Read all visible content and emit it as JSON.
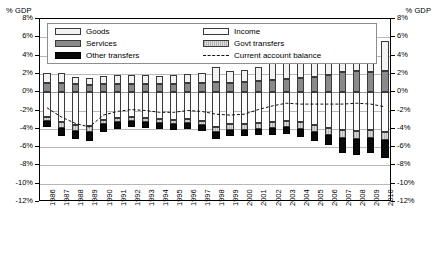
{
  "axis_unit_left": "% GDP",
  "axis_unit_right": "% GDP",
  "legend": {
    "goods": "Goods",
    "services": "Services",
    "other_transfers": "Other transfers",
    "income": "Income",
    "govt_transfers": "Govt transfers",
    "current_account_balance": "Current account balance"
  },
  "chart_data": {
    "type": "bar",
    "title": "",
    "subtitle": "",
    "xlabel": "",
    "ylabel": "% GDP",
    "ylim": [
      -12,
      8
    ],
    "ytick_step": 2,
    "grid": true,
    "stacked": true,
    "legend_position": "top-inside",
    "ytick_labels": [
      "8%",
      "6%",
      "4%",
      "2%",
      "0%",
      "-2%",
      "-4%",
      "-6%",
      "-8%",
      "-10%",
      "-12%"
    ],
    "categories": [
      "1986",
      "1987",
      "1988",
      "1989",
      "1990",
      "1991",
      "1992",
      "1993",
      "1994",
      "1995",
      "1996",
      "1997",
      "1998",
      "1999",
      "2000",
      "2001",
      "2002",
      "2003",
      "2004",
      "2005",
      "2006",
      "2007",
      "2008",
      "2009",
      "2010"
    ],
    "series": [
      {
        "name": "Goods",
        "values": [
          1.1,
          1.1,
          0.8,
          0.7,
          0.9,
          1.0,
          1.0,
          1.0,
          0.9,
          1.0,
          1.0,
          1.1,
          1.6,
          1.3,
          1.3,
          1.6,
          1.9,
          2.0,
          2.1,
          2.3,
          2.6,
          3.1,
          3.4,
          3.2,
          3.3
        ]
      },
      {
        "name": "Services",
        "values": [
          1.0,
          1.0,
          0.9,
          0.8,
          0.9,
          0.9,
          0.9,
          0.9,
          0.9,
          0.9,
          1.0,
          1.0,
          1.1,
          1.0,
          1.1,
          1.2,
          1.3,
          1.4,
          1.5,
          1.7,
          1.9,
          2.2,
          2.3,
          2.2,
          2.3
        ]
      },
      {
        "name": "Income",
        "values": [
          -2.7,
          -3.3,
          -3.6,
          -3.7,
          -3.0,
          -2.8,
          -2.7,
          -2.8,
          -2.9,
          -3.0,
          -2.9,
          -3.1,
          -3.8,
          -3.5,
          -3.5,
          -3.4,
          -3.3,
          -3.2,
          -3.3,
          -3.6,
          -3.9,
          -4.1,
          -4.2,
          -4.1,
          -4.3
        ]
      },
      {
        "name": "Govt transfers",
        "values": [
          -0.5,
          -0.6,
          -0.6,
          -0.6,
          -0.5,
          -0.5,
          -0.5,
          -0.5,
          -0.5,
          -0.5,
          -0.5,
          -0.5,
          -0.6,
          -0.6,
          -0.6,
          -0.6,
          -0.6,
          -0.6,
          -0.7,
          -0.7,
          -0.8,
          -0.9,
          -0.9,
          -0.9,
          -0.9
        ]
      },
      {
        "name": "Other transfers",
        "values": [
          -0.6,
          -0.9,
          -0.9,
          -1.0,
          -0.8,
          -0.7,
          -0.6,
          -0.6,
          -0.6,
          -0.6,
          -0.6,
          -0.6,
          -0.7,
          -0.7,
          -0.7,
          -0.7,
          -0.8,
          -0.8,
          -0.9,
          -1.0,
          -1.1,
          -1.6,
          -1.8,
          -1.7,
          -2.0
        ]
      },
      {
        "name": "Current account balance",
        "type": "line",
        "style": "dashed",
        "values": [
          -1.7,
          -2.7,
          -3.4,
          -3.8,
          -2.5,
          -2.1,
          -1.9,
          -2.0,
          -2.2,
          -2.2,
          -2.0,
          -2.1,
          -2.4,
          -2.5,
          -2.4,
          -1.9,
          -1.5,
          -1.2,
          -1.3,
          -1.3,
          -1.3,
          -1.3,
          -1.2,
          -1.3,
          -1.6
        ]
      }
    ]
  }
}
